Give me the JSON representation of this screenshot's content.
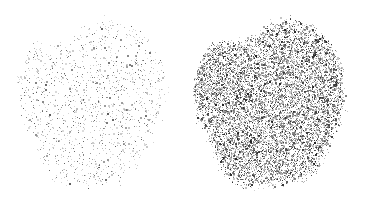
{
  "figure": {
    "width": 377,
    "height": 211,
    "background_color": "#ffffff",
    "panel_count": 2
  },
  "chart_data": {
    "type": "scatter",
    "title": "",
    "subtitle": "",
    "xlabel": "",
    "ylabel": "",
    "grid": false,
    "legend": "none",
    "axes_visible": false,
    "tick_labels": [],
    "annotations": [],
    "xlim": [
      0,
      377
    ],
    "ylim": [
      0,
      211
    ],
    "marker": "square",
    "marker_size_px": 1,
    "shared_silhouette": {
      "name": "lobed-blob",
      "normalized_center": [
        0.5,
        0.5
      ],
      "base_radius": 0.46,
      "lobe_harmonics": [
        {
          "order": 2,
          "amplitude": 0.055,
          "phase": 0.7
        },
        {
          "order": 3,
          "amplitude": 0.075,
          "phase": 2.1
        },
        {
          "order": 4,
          "amplitude": 0.045,
          "phase": 4.3
        },
        {
          "order": 5,
          "amplitude": 0.03,
          "phase": 1.2
        },
        {
          "order": 7,
          "amplitude": 0.018,
          "phase": 5.1
        }
      ],
      "edge_falloff": 0.14
    },
    "series": [
      {
        "name": "sparse-cloud",
        "panel": "left",
        "point_count": 1450,
        "density": 0.16,
        "color_min": "#b4b4b4",
        "color_max": "#5a5a5a",
        "mean_gray": "#c8c8c8",
        "center_x": 92,
        "center_y": 103,
        "radius_x": 78,
        "radius_y": 92,
        "seed": 20461
      },
      {
        "name": "dense-cloud",
        "panel": "right",
        "point_count": 9800,
        "density": 0.58,
        "color_min": "#9a9a9a",
        "color_max": "#202020",
        "mean_gray": "#707070",
        "center_x": 271,
        "center_y": 103,
        "radius_x": 79,
        "radius_y": 92,
        "seed": 77123
      }
    ]
  },
  "panels": [
    {
      "id": "panel-left",
      "label": "sparse point cloud",
      "x": 0,
      "y": 0,
      "width": 188,
      "height": 211
    },
    {
      "id": "panel-right",
      "label": "dense point cloud",
      "x": 188,
      "y": 0,
      "width": 189,
      "height": 211
    }
  ]
}
